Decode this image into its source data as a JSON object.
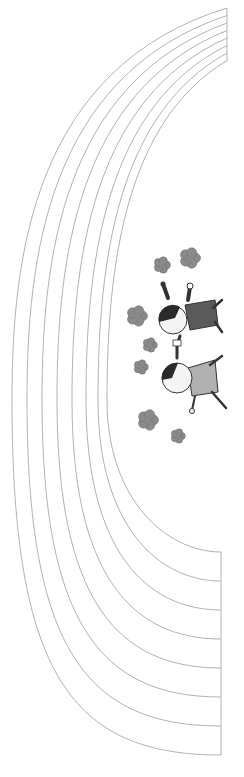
{
  "scene": {
    "description": "Rainbow outline arcs with two cartoon children holding hands among flowers",
    "colors": {
      "background": "#ffffff",
      "arc_stroke": "#a8a8a8",
      "flower_fill": "#8a8a8a",
      "flower_edge": "#6a6a6a",
      "hair": "#2a2a2a",
      "skin": "#f4f4f4",
      "shirt_girl": "#5a5a5a",
      "shirt_boy": "#b0b0b0",
      "line": "#333333"
    },
    "arcs": {
      "count": 8,
      "top_end_x": 227,
      "top_end_y": [
        8,
        15.5,
        23,
        30.5,
        38,
        45.5,
        53,
        60.5
      ],
      "bottom_end_x": 221,
      "bottom_end_y": [
        755,
        726,
        697,
        668,
        639,
        610,
        581,
        552
      ],
      "mid_x_at_400": [
        12,
        27,
        42,
        57,
        72,
        86,
        98,
        107
      ]
    },
    "flowers": [
      {
        "x": 162,
        "y": 265,
        "r": 8
      },
      {
        "x": 190,
        "y": 258,
        "r": 10
      },
      {
        "x": 137,
        "y": 316,
        "r": 10
      },
      {
        "x": 150,
        "y": 345,
        "r": 7
      },
      {
        "x": 141,
        "y": 367,
        "r": 7
      },
      {
        "x": 148,
        "y": 420,
        "r": 10
      },
      {
        "x": 178,
        "y": 436,
        "r": 7
      }
    ],
    "characters": [
      {
        "name": "girl",
        "head": {
          "x": 173,
          "y": 320,
          "r": 14
        }
      },
      {
        "name": "boy",
        "head": {
          "x": 177,
          "y": 378,
          "r": 15
        }
      }
    ]
  }
}
